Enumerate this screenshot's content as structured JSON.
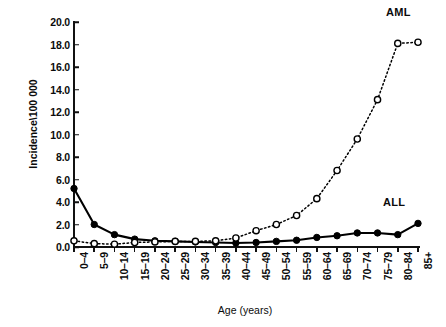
{
  "chart_data": {
    "type": "line",
    "title": "",
    "xlabel": "Age (years)",
    "ylabel": "Incidence\\100 000",
    "categories": [
      "0–4",
      "5–9",
      "10–14",
      "15–19",
      "20–24",
      "25–29",
      "30–34",
      "35–39",
      "40–44",
      "45–49",
      "50–54",
      "55–59",
      "60–64",
      "65–69",
      "70–74",
      "75–79",
      "80–84",
      "85+"
    ],
    "ylim": [
      0.0,
      20.0
    ],
    "yticks": [
      "0.0",
      "2.0",
      "4.0",
      "6.0",
      "8.0",
      "10.0",
      "12.0",
      "14.0",
      "16.0",
      "18.0",
      "20.0"
    ],
    "ytick_values": [
      0.0,
      2.0,
      4.0,
      6.0,
      8.0,
      10.0,
      12.0,
      14.0,
      16.0,
      18.0,
      20.0
    ],
    "grid": false,
    "legend_position": "inline-annotation",
    "series": [
      {
        "name": "ALL",
        "marker": "filled-circle",
        "line_style": "solid",
        "color": "#000000",
        "values": [
          5.2,
          2.0,
          1.1,
          0.7,
          0.55,
          0.5,
          0.45,
          0.4,
          0.35,
          0.4,
          0.5,
          0.6,
          0.85,
          1.0,
          1.25,
          1.25,
          1.1,
          2.1
        ]
      },
      {
        "name": "AML",
        "marker": "open-circle",
        "line_style": "dotted",
        "color": "#000000",
        "values": [
          0.55,
          0.3,
          0.25,
          0.4,
          0.45,
          0.5,
          0.5,
          0.55,
          0.8,
          1.45,
          2.0,
          2.8,
          4.3,
          6.8,
          9.6,
          13.1,
          18.1,
          18.2
        ]
      }
    ],
    "annotations": [
      {
        "text": "AML",
        "series": "AML"
      },
      {
        "text": "ALL",
        "series": "ALL"
      }
    ]
  }
}
